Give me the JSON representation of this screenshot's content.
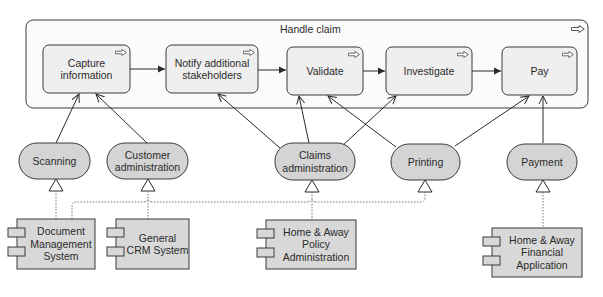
{
  "container": {
    "title": "Handle claim",
    "icon": "process-arrow-icon"
  },
  "processes": [
    {
      "id": "capture",
      "label": "Capture information"
    },
    {
      "id": "notify",
      "label": "Notify additional stakeholders"
    },
    {
      "id": "validate",
      "label": "Validate"
    },
    {
      "id": "investigate",
      "label": "Investigate"
    },
    {
      "id": "pay",
      "label": "Pay"
    }
  ],
  "services": [
    {
      "id": "scanning",
      "label": "Scanning"
    },
    {
      "id": "customer-admin",
      "label": "Customer administration"
    },
    {
      "id": "claims-admin",
      "label": "Claims administration"
    },
    {
      "id": "printing",
      "label": "Printing"
    },
    {
      "id": "payment",
      "label": "Payment"
    }
  ],
  "components": [
    {
      "id": "dms",
      "label": "Document Management System"
    },
    {
      "id": "crm",
      "label": "General CRM System"
    },
    {
      "id": "policy",
      "label": "Home & Away Policy Administration"
    },
    {
      "id": "financial",
      "label": "Home & Away Financial Application"
    }
  ],
  "colors": {
    "process_fill": "#efefef",
    "service_fill": "#d4d4d4",
    "component_fill": "#d8d8d8",
    "stroke": "#3a3a3a"
  }
}
